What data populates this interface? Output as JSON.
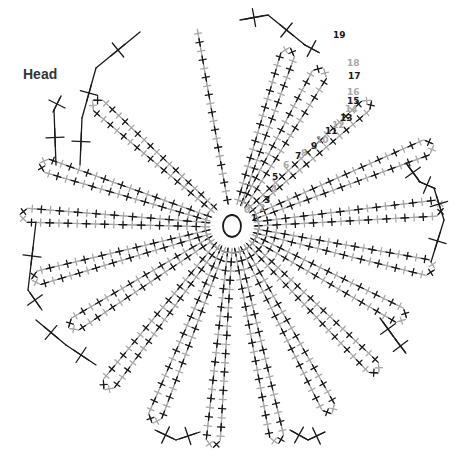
{
  "title": "Head",
  "colors": {
    "dark": "#1a1a1a",
    "light": "#a8a8a8",
    "background": "#ffffff"
  },
  "legend": {
    "stitch_symbol": "single crochet (+)",
    "increase_symbol": "sc2tog / increase (V)",
    "row_colors": "alternating black and gray per row"
  },
  "row_numbers": [
    {
      "n": "0",
      "x": 244,
      "y": 213,
      "color": "light"
    },
    {
      "n": "1",
      "x": 251,
      "y": 221,
      "color": "dark"
    },
    {
      "n": "2",
      "x": 259,
      "y": 211,
      "color": "light"
    },
    {
      "n": "3",
      "x": 264,
      "y": 203,
      "color": "dark"
    },
    {
      "n": "4",
      "x": 271,
      "y": 192,
      "color": "light"
    },
    {
      "n": "5",
      "x": 272,
      "y": 180,
      "color": "dark"
    },
    {
      "n": "6",
      "x": 283,
      "y": 168,
      "color": "light"
    },
    {
      "n": "7",
      "x": 295,
      "y": 159,
      "color": "dark"
    },
    {
      "n": "8",
      "x": 301,
      "y": 156,
      "color": "light"
    },
    {
      "n": "9",
      "x": 311,
      "y": 149,
      "color": "dark"
    },
    {
      "n": "10",
      "x": 316,
      "y": 143,
      "color": "light"
    },
    {
      "n": "11",
      "x": 325,
      "y": 134,
      "color": "dark"
    },
    {
      "n": "12",
      "x": 332,
      "y": 128,
      "color": "light"
    },
    {
      "n": "13",
      "x": 340,
      "y": 121,
      "color": "dark"
    },
    {
      "n": "14",
      "x": 345,
      "y": 112,
      "color": "light"
    },
    {
      "n": "15",
      "x": 347,
      "y": 104,
      "color": "dark"
    },
    {
      "n": "16",
      "x": 347,
      "y": 95,
      "color": "light"
    },
    {
      "n": "17",
      "x": 348,
      "y": 79,
      "color": "dark"
    },
    {
      "n": "18",
      "x": 347,
      "y": 66,
      "color": "light"
    },
    {
      "n": "19",
      "x": 333,
      "y": 38,
      "color": "dark"
    }
  ]
}
